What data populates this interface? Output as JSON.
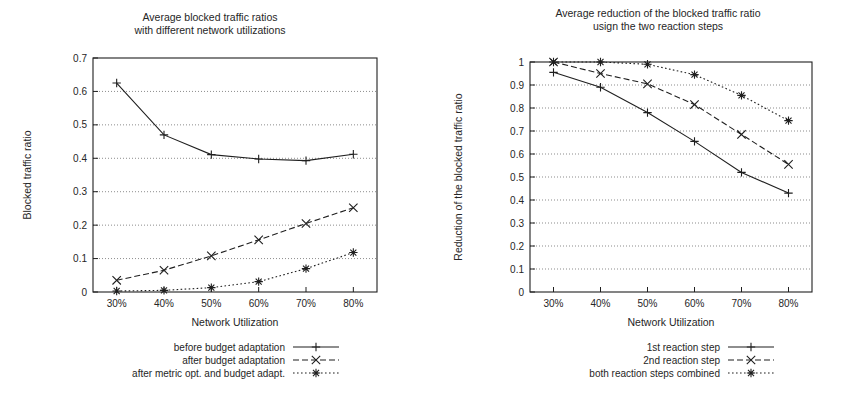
{
  "figure": {
    "background_color": "#ffffff",
    "ink_color": "#1f1f1f",
    "grid_color": "#5a5a5a"
  },
  "chart_data": [
    {
      "id": "left",
      "type": "line",
      "title": "Average blocked traffic ratios",
      "subtitle": "with different network utilizations",
      "xlabel": "Network Utilization",
      "ylabel": "Blocked traffic ratio",
      "categories": [
        "30%",
        "40%",
        "50%",
        "60%",
        "70%",
        "80%"
      ],
      "x": [
        30,
        40,
        50,
        60,
        70,
        80
      ],
      "xlim": [
        25,
        85
      ],
      "ylim": [
        0,
        0.7
      ],
      "yticks": [
        "0",
        "0.1",
        "0.2",
        "0.3",
        "0.4",
        "0.5",
        "0.6",
        "0.7"
      ],
      "ytickvalues": [
        0,
        0.1,
        0.2,
        0.3,
        0.4,
        0.5,
        0.6,
        0.7
      ],
      "grid": true,
      "legend_position": "below-right",
      "series": [
        {
          "name": "before budget adaptation",
          "values": [
            0.625,
            0.47,
            0.411,
            0.398,
            0.393,
            0.412
          ],
          "dash": "none",
          "marker": "plus",
          "linewidth": 1.1
        },
        {
          "name": "after budget adaptation",
          "values": [
            0.035,
            0.065,
            0.108,
            0.156,
            0.205,
            0.252
          ],
          "dash": "dashed",
          "marker": "cross",
          "linewidth": 1.1
        },
        {
          "name": "after metric opt. and budget adapt.",
          "values": [
            0.003,
            0.005,
            0.013,
            0.031,
            0.07,
            0.118
          ],
          "dash": "dotted",
          "marker": "star",
          "linewidth": 1.1
        }
      ]
    },
    {
      "id": "right",
      "type": "line",
      "title": "Average reduction of the blocked traffic ratio",
      "subtitle": "usign the two reaction steps",
      "xlabel": "Network Utilization",
      "ylabel": "Reduction of the blocked traffic ratio",
      "categories": [
        "30%",
        "40%",
        "50%",
        "60%",
        "70%",
        "80%"
      ],
      "x": [
        30,
        40,
        50,
        60,
        70,
        80
      ],
      "xlim": [
        25,
        85
      ],
      "ylim": [
        0,
        1
      ],
      "yticks": [
        "0",
        "0.1",
        "0.2",
        "0.3",
        "0.4",
        "0.5",
        "0.6",
        "0.7",
        "0.8",
        "0.9",
        "1"
      ],
      "ytickvalues": [
        0,
        0.1,
        0.2,
        0.3,
        0.4,
        0.5,
        0.6,
        0.7,
        0.8,
        0.9,
        1
      ],
      "grid": true,
      "legend_position": "below-right",
      "series": [
        {
          "name": "1st reaction step",
          "values": [
            0.955,
            0.89,
            0.78,
            0.655,
            0.52,
            0.43
          ],
          "dash": "none",
          "marker": "plus",
          "linewidth": 1.1
        },
        {
          "name": "2nd reaction step",
          "values": [
            1.0,
            0.95,
            0.905,
            0.815,
            0.685,
            0.555
          ],
          "dash": "dashed",
          "marker": "cross",
          "linewidth": 1.1
        },
        {
          "name": "both reaction steps combined",
          "values": [
            1.0,
            1.0,
            0.99,
            0.945,
            0.855,
            0.745
          ],
          "dash": "dotted",
          "marker": "star",
          "linewidth": 1.1
        }
      ]
    }
  ]
}
